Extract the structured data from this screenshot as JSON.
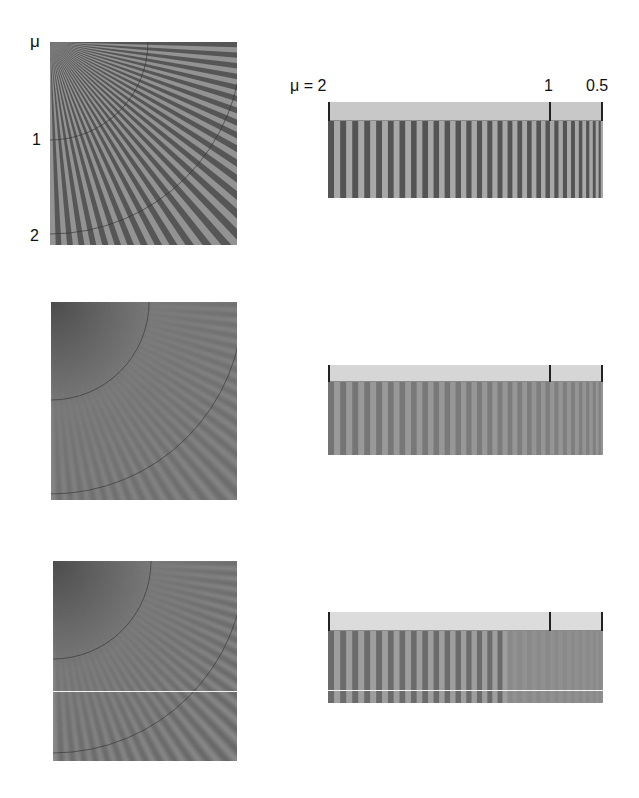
{
  "figure": {
    "left_labels": {
      "mu_symbol": "μ",
      "mu_1": "1",
      "mu_2": "2"
    },
    "bar_labels": {
      "mu_eq_2": "μ = 2",
      "mu_1": "1",
      "mu_0_5": "0.5"
    },
    "rows": [
      {
        "name": "original",
        "panel_description": "radial ray pattern, sharp high-contrast stripes",
        "bar_description": "sharp vertical stripes increasing in frequency left to right",
        "stripe_count": 28,
        "contrast": 1.0
      },
      {
        "name": "reconstruction-a",
        "panel_description": "blurred radial pattern with moiré/aliasing near origin",
        "bar_description": "low-contrast stripes fading toward right",
        "stripe_count": 28,
        "contrast": 0.45
      },
      {
        "name": "reconstruction-b",
        "panel_description": "blurred radial pattern, detail lost near origin",
        "bar_description": "stripes visible until μ≈1, then washed out",
        "stripe_count": 28,
        "contrast": 0.6
      }
    ],
    "colors": {
      "dark_stripe": "#585858",
      "light_stripe": "#a0a0a0",
      "arc": "#333333",
      "header": "#c8c8c8"
    }
  }
}
